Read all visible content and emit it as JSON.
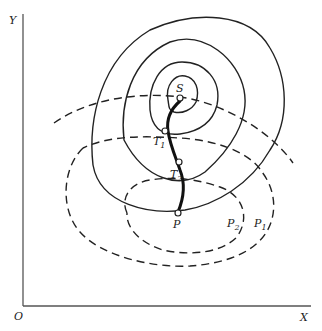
{
  "figure": {
    "axes": {
      "x_label": "X",
      "y_label": "Y",
      "origin_label": "O"
    },
    "points": {
      "summit": "S",
      "t1": "T",
      "t1_sub": "1",
      "t2": "T",
      "t2_sub": "2",
      "start": "P"
    },
    "constraint_labels": {
      "p1": "P",
      "p1_sub": "1",
      "p2": "P",
      "p2_sub": "2"
    },
    "colors": {
      "line": "#222222",
      "axis": "#555555",
      "background": "#ffffff"
    }
  }
}
